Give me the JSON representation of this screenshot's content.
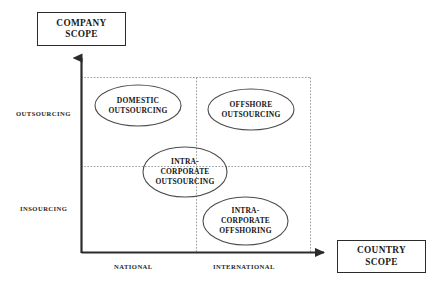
{
  "diagram": {
    "title_axes": {
      "y_axis_box": {
        "name": "company-scope",
        "line1": "COMPANY",
        "line2": "SCOPE"
      },
      "x_axis_box": {
        "name": "country-scope",
        "line1": "COUNTRY",
        "line2": "SCOPE"
      }
    },
    "y_axis_ticks": [
      {
        "id": "outsourcing",
        "label": "OUTSOURCING"
      },
      {
        "id": "insourcing",
        "label": "INSOURCING"
      }
    ],
    "x_axis_ticks": [
      {
        "id": "national",
        "label": "NATIONAL"
      },
      {
        "id": "international",
        "label": "INTERNATIONAL"
      }
    ],
    "bubbles": [
      {
        "id": "domestic-outsourcing",
        "lines": [
          "DOMESTIC",
          "OUTSOURCING"
        ],
        "quadrant": "national-outsourcing"
      },
      {
        "id": "offshore-outsourcing",
        "lines": [
          "OFFSHORE",
          "OUTSOURCING"
        ],
        "quadrant": "international-outsourcing"
      },
      {
        "id": "intra-corporate-outsourcing",
        "lines": [
          "INTRA-",
          "CORPORATE",
          "OUTSOURCING"
        ],
        "quadrant": "center"
      },
      {
        "id": "intra-corporate-offshoring",
        "lines": [
          "INTRA-",
          "CORPORATE",
          "OFFSHORING"
        ],
        "quadrant": "international-insourcing"
      }
    ],
    "colors": {
      "axis_line": "#2b2b2b",
      "grid_line": "#9a9a9a",
      "ellipse_stroke": "#4d4d4d",
      "text": "#141414",
      "background": "#ffffff"
    }
  }
}
